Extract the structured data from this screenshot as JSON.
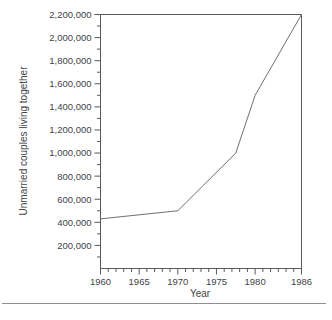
{
  "chart_data": {
    "type": "line",
    "title": "",
    "xlabel": "Year",
    "ylabel": "Unmarried couples living together",
    "xlim": [
      1960,
      1986
    ],
    "ylim": [
      0,
      2200000
    ],
    "grid": false,
    "legend": "none",
    "x_ticks": [
      1960,
      1965,
      1970,
      1975,
      1980,
      1986
    ],
    "x_tick_labels": [
      "1960",
      "1965",
      "1970",
      "1975",
      "1980",
      "1986"
    ],
    "x_minor_tick_step": 1,
    "y_ticks": [
      200000,
      400000,
      600000,
      800000,
      1000000,
      1200000,
      1400000,
      1600000,
      1800000,
      2000000,
      2200000
    ],
    "y_tick_labels": [
      "200,000",
      "400,000",
      "600,000",
      "800,000",
      "1,000,000",
      "1,200,000",
      "1,400,000",
      "1,600,000",
      "1,800,000",
      "2,000,000",
      "2,200,000"
    ],
    "y_minor_tick_step": 100000,
    "series": [
      {
        "name": "Unmarried couples living together",
        "color": "#6b7074",
        "x": [
          1960,
          1970,
          1977.5,
          1980,
          1986
        ],
        "values": [
          430000,
          500000,
          1000000,
          1500000,
          2200000
        ]
      }
    ]
  },
  "axes": {
    "x_title": "Year",
    "y_title": "Unmarried couples living together"
  },
  "colors": {
    "line": "#6b7074",
    "axis": "#555a5e",
    "text": "#3f4347",
    "background": "#ffffff",
    "rule": "#8c9094"
  }
}
